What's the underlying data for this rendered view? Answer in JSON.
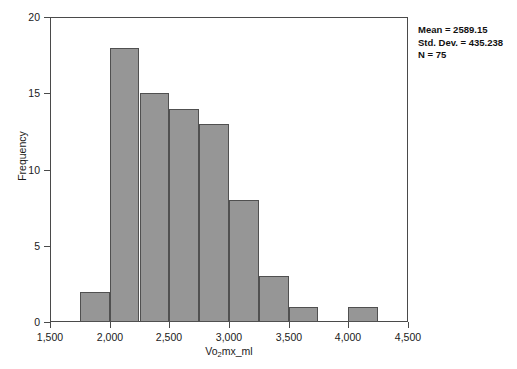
{
  "chart_data": {
    "type": "bar",
    "chart_subtype": "histogram",
    "title": "",
    "xlabel": "Vo2mx_ml",
    "xlabel_parts": {
      "pre": "Vo",
      "sub": "2",
      "post": "mx_ml"
    },
    "ylabel": "Frequency",
    "xlim": [
      1500,
      4500
    ],
    "ylim": [
      0,
      20
    ],
    "xticks": [
      1500,
      2000,
      2500,
      3000,
      3500,
      4000,
      4500
    ],
    "xtick_labels": [
      "1,500",
      "2,000",
      "2,500",
      "3,000",
      "3,500",
      "4,000",
      "4,500"
    ],
    "yticks": [
      0,
      5,
      10,
      15,
      20
    ],
    "ytick_labels": [
      "0",
      "5",
      "10",
      "15",
      "20"
    ],
    "grid": false,
    "legend": false,
    "bin_width": 250,
    "bins": [
      {
        "start": 1750,
        "end": 2000,
        "count": 2
      },
      {
        "start": 2000,
        "end": 2250,
        "count": 18
      },
      {
        "start": 2250,
        "end": 2500,
        "count": 15
      },
      {
        "start": 2500,
        "end": 2750,
        "count": 14
      },
      {
        "start": 2750,
        "end": 3000,
        "count": 13
      },
      {
        "start": 3000,
        "end": 3250,
        "count": 8
      },
      {
        "start": 3250,
        "end": 3500,
        "count": 3
      },
      {
        "start": 3500,
        "end": 3750,
        "count": 1
      },
      {
        "start": 3750,
        "end": 4000,
        "count": 0
      },
      {
        "start": 4000,
        "end": 4250,
        "count": 1
      }
    ],
    "values": [
      2,
      18,
      15,
      14,
      13,
      8,
      3,
      1,
      0,
      1
    ],
    "categories": [
      "1750-2000",
      "2000-2250",
      "2250-2500",
      "2500-2750",
      "2750-3000",
      "3000-3250",
      "3250-3500",
      "3500-3750",
      "3750-4000",
      "4000-4250"
    ],
    "bar_fill_color": "#969696",
    "bar_edge_color": "#505050",
    "annotations": {
      "mean_label": "Mean = 2589.15",
      "std_dev_label": "Std. Dev. = 435.238",
      "n_label": "N = 75",
      "mean": 2589.15,
      "std_dev": 435.238,
      "n": 75
    }
  }
}
